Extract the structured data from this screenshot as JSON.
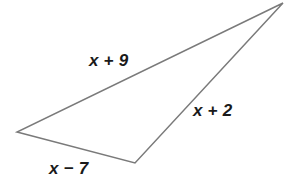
{
  "figure": {
    "type": "triangle",
    "stroke_color": "#7a7a7a",
    "stroke_width": 1.5,
    "background_color": "#ffffff",
    "label_color": "#1a1a1a",
    "vertices": {
      "apex": {
        "x": 283,
        "y": 3
      },
      "left": {
        "x": 17,
        "y": 132
      },
      "bottom": {
        "x": 135,
        "y": 163
      }
    },
    "points_attr": "283,3 17,132 135,163",
    "labels": {
      "top_side": "x + 9",
      "right_side": "x + 2",
      "bottom_side": "x − 7"
    }
  }
}
